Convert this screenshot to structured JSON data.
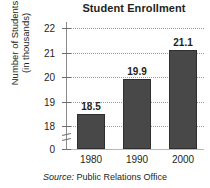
{
  "chart_data": {
    "type": "bar",
    "title": "Student Enrollment",
    "xlabel": "",
    "ylabel_line1": "Number of Students",
    "ylabel_line2": "(in thousands)",
    "categories": [
      "1980",
      "1990",
      "2000"
    ],
    "values": [
      18.5,
      19.9,
      21.1
    ],
    "value_labels": [
      "18.5",
      "19.9",
      "21.1"
    ],
    "ytick_labels": [
      "22",
      "21",
      "20",
      "19",
      "18",
      "0"
    ],
    "ytick_values": [
      22,
      21,
      20,
      19,
      18,
      0
    ],
    "ylim": [
      17.6,
      22.4
    ],
    "axis_break": true,
    "axis_break_note": "y-axis broken between 18 and 0",
    "grid": true,
    "grid_style": "dotted-horizontal",
    "legend": "none",
    "series": [
      {
        "name": "Enrollment",
        "values": [
          18.5,
          19.9,
          21.1
        ]
      }
    ],
    "bar_color": "#484848",
    "grid_color": "#9a9a9a",
    "axis_color": "#8a8a8a"
  },
  "source": {
    "keyword": "Source:",
    "text": "Public Relations Office"
  }
}
